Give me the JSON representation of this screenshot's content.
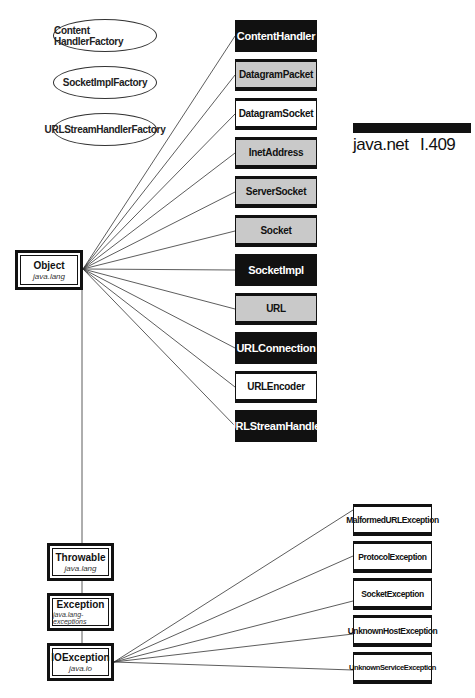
{
  "header": {
    "package": "java.net",
    "page_ref": "I.409"
  },
  "interfaces": [
    {
      "label": "Content HandlerFactory"
    },
    {
      "label": "SocketImplFactory"
    },
    {
      "label": "URLStreamHandlerFactory"
    }
  ],
  "object_box": {
    "title": "Object",
    "package": "java.lang"
  },
  "classes": [
    {
      "label": "ContentHandler",
      "style": "black"
    },
    {
      "label": "DatagramPacket",
      "style": "gray"
    },
    {
      "label": "DatagramSocket",
      "style": "white"
    },
    {
      "label": "InetAddress",
      "style": "gray"
    },
    {
      "label": "ServerSocket",
      "style": "gray"
    },
    {
      "label": "Socket",
      "style": "gray"
    },
    {
      "label": "SocketImpl",
      "style": "black"
    },
    {
      "label": "URL",
      "style": "gray"
    },
    {
      "label": "URLConnection",
      "style": "black"
    },
    {
      "label": "URLEncoder",
      "style": "white"
    },
    {
      "label": "URLStreamHandler",
      "style": "black"
    }
  ],
  "hierarchy": [
    {
      "title": "Throwable",
      "package": "java.lang"
    },
    {
      "title": "Exception",
      "package": "java.lang-exceptions"
    },
    {
      "title": "IOException",
      "package": "java.io"
    }
  ],
  "exceptions": [
    {
      "label": "MalformedURLException"
    },
    {
      "label": "ProtocolException"
    },
    {
      "label": "SocketException"
    },
    {
      "label": "UnknownHostException"
    },
    {
      "label": "UnknownServiceException"
    }
  ]
}
